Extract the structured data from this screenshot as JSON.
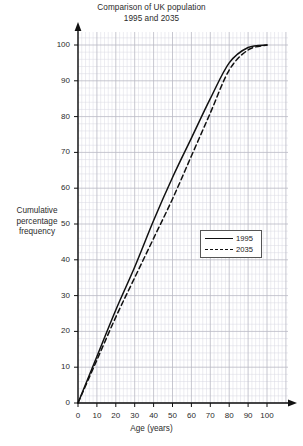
{
  "chart_data": {
    "type": "line",
    "title": "Comparison of UK population 1995 and 2035",
    "title_line1": "Comparison of UK population",
    "title_line2": "1995 and 2035",
    "xlabel": "Age (years)",
    "ylabel": "Cumulative percentage frequency",
    "ylabel_line1": "Cumulative",
    "ylabel_line2": "percentage",
    "ylabel_line3": "frequency",
    "xlim": [
      0,
      100
    ],
    "ylim": [
      0,
      100
    ],
    "xticks": [
      0,
      10,
      20,
      30,
      40,
      50,
      60,
      70,
      80,
      90,
      100
    ],
    "yticks": [
      0,
      10,
      20,
      30,
      40,
      50,
      60,
      70,
      80,
      90,
      100
    ],
    "xtick_labels": [
      "0",
      "10",
      "20",
      "30",
      "40",
      "50",
      "60",
      "70",
      "80",
      "90",
      "100"
    ],
    "ytick_labels": [
      "0",
      "10",
      "20",
      "30",
      "40",
      "50",
      "60",
      "70",
      "80",
      "90",
      "100"
    ],
    "grid": true,
    "grid_major_step": 10,
    "grid_minor_step": 2,
    "grid_color": "#b9b9c4",
    "grid_minor_color": "#d9d9e2",
    "axis_color": "#111111",
    "legend_position": "center-right",
    "x": [
      0,
      10,
      20,
      30,
      40,
      50,
      60,
      70,
      80,
      90,
      100
    ],
    "series": [
      {
        "name": "1995",
        "style": "solid",
        "color": "#111111",
        "values": [
          0,
          13,
          26,
          38,
          51,
          63,
          74,
          85,
          95,
          99.3,
          100
        ]
      },
      {
        "name": "2035",
        "style": "dashed",
        "color": "#111111",
        "values": [
          0,
          12,
          24,
          35,
          46,
          57,
          69,
          81,
          93,
          98.6,
          100
        ]
      }
    ],
    "legend": [
      {
        "label": "1995",
        "style": "solid"
      },
      {
        "label": "2035",
        "style": "dashed"
      }
    ]
  }
}
